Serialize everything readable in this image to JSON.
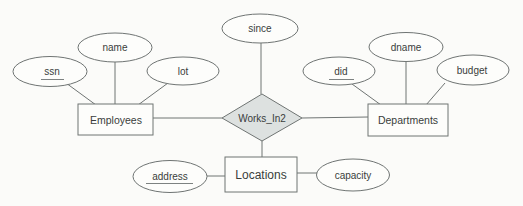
{
  "diagram": {
    "kind": "entity-relationship-diagram",
    "relationship": {
      "label": "Works_In2",
      "attributes": [
        {
          "label": "since",
          "key": false
        }
      ],
      "connects": [
        "Employees",
        "Departments",
        "Locations"
      ]
    },
    "entities": [
      {
        "label": "Employees",
        "attributes": [
          {
            "label": "ssn",
            "key": true
          },
          {
            "label": "name",
            "key": false
          },
          {
            "label": "lot",
            "key": false
          }
        ]
      },
      {
        "label": "Departments",
        "attributes": [
          {
            "label": "did",
            "key": true
          },
          {
            "label": "dname",
            "key": false
          },
          {
            "label": "budget",
            "key": false
          }
        ]
      },
      {
        "label": "Locations",
        "attributes": [
          {
            "label": "address",
            "key": true
          },
          {
            "label": "capacity",
            "key": false
          }
        ]
      }
    ],
    "colors": {
      "relationship_fill": "#dde1e0",
      "shape_fill": "#fdfdfb",
      "stroke": "#6f7473",
      "text": "#3a3d3c",
      "background": "#fbfbf9"
    }
  }
}
